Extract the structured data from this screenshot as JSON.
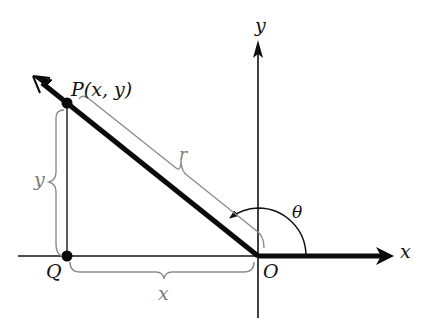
{
  "diagram": {
    "type": "coordinate-geometry",
    "colors": {
      "axis": "#111111",
      "ray": "#0a0a0a",
      "brace": "#8c8c8c",
      "label_dark": "#111111",
      "label_gray": "#7a7a7a",
      "background": "#ffffff"
    },
    "labels": {
      "point_p": "P(x, y)",
      "point_q": "Q",
      "origin": "O",
      "x_axis": "x",
      "y_axis": "y",
      "radius": "r",
      "horizontal_brace": "x",
      "vertical_brace": "y",
      "angle": "θ"
    },
    "points": {
      "O": [
        258,
        256
      ],
      "P": [
        67,
        103
      ],
      "Q": [
        67,
        256
      ]
    }
  }
}
